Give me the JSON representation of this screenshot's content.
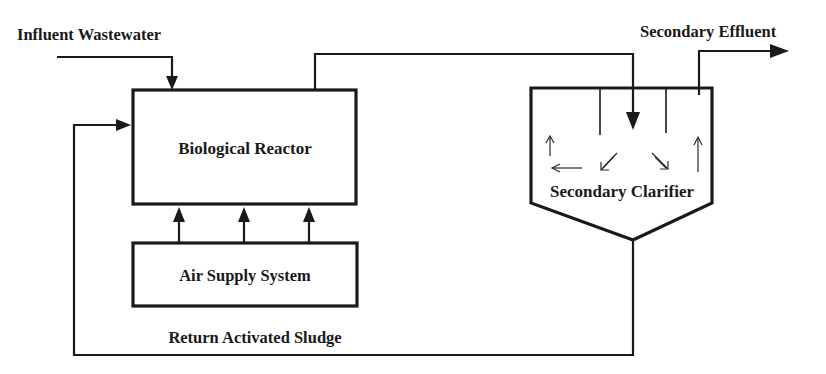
{
  "diagram": {
    "labels": {
      "influent": "Influent Wastewater",
      "effluent": "Secondary Effluent",
      "reactor": "Biological Reactor",
      "air_supply": "Air Supply System",
      "clarifier": "Secondary Clarifier",
      "return_sludge": "Return Activated Sludge"
    },
    "nodes": [
      {
        "id": "reactor",
        "label": "Biological Reactor",
        "shape": "rectangle"
      },
      {
        "id": "air_supply",
        "label": "Air Supply System",
        "shape": "rectangle"
      },
      {
        "id": "clarifier",
        "label": "Secondary Clarifier",
        "shape": "pentagon-hopper"
      }
    ],
    "edges": [
      {
        "from": "influent",
        "to": "reactor",
        "label": "Influent Wastewater"
      },
      {
        "from": "air_supply",
        "to": "reactor",
        "count": 3
      },
      {
        "from": "reactor",
        "to": "clarifier"
      },
      {
        "from": "clarifier",
        "to": "effluent",
        "label": "Secondary Effluent"
      },
      {
        "from": "clarifier",
        "to": "reactor",
        "label": "Return Activated Sludge"
      }
    ],
    "colors": {
      "line": "#1a1a1a",
      "background": "#ffffff"
    }
  }
}
